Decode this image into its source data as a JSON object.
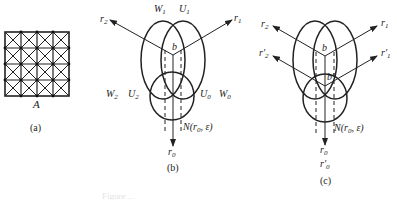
{
  "panel_a": {
    "label": "A",
    "caption": "(a)",
    "grid": {
      "rows": 4,
      "cols": 4,
      "diagonals": true,
      "vertex_dots": true
    }
  },
  "panel_b": {
    "caption": "(b)",
    "arrows": {
      "r1": "r",
      "r1_sub": "1",
      "r2": "r",
      "r2_sub": "2",
      "r0": "r",
      "r0_sub": "0"
    },
    "point": "b",
    "regions": {
      "W1": "W",
      "W1_sub": "1",
      "U1": "U",
      "U1_sub": "1",
      "W2": "W",
      "W2_sub": "2",
      "U2": "U",
      "U2_sub": "2",
      "U0": "U",
      "U0_sub": "0",
      "W0": "W",
      "W0_sub": "0"
    },
    "neighborhood": "N(r",
    "neighborhood_sub": "0",
    "neighborhood_tail": ", ε)"
  },
  "panel_c": {
    "caption": "(c)",
    "arrows": {
      "r1": "r",
      "r1_sub": "1",
      "r2": "r",
      "r2_sub": "2",
      "r1p": "r′",
      "r1p_sub": "1",
      "r2p": "r′",
      "r2p_sub": "2",
      "r0": "r",
      "r0_sub": "0",
      "r0p": "r′",
      "r0p_sub": "0"
    },
    "point": "b",
    "point_prime": "b′",
    "neighborhood": "N(r",
    "neighborhood_sub": "0",
    "neighborhood_tail": ", ε)"
  },
  "figure_caption_partial": "Figure ..."
}
